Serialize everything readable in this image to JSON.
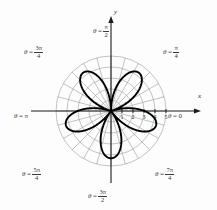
{
  "figure": {
    "name": "polar-rose-plot",
    "background": "#fdfdfd"
  },
  "axes": {
    "x_axis_label": "x",
    "y_axis_label": "y",
    "center_x": 111,
    "center_y": 111,
    "unit_px": 11,
    "grid_color": "#9a9a9a",
    "axis_color": "#1a1a1a",
    "curve_color": "#000000"
  },
  "tick_labels": [
    {
      "text": "1",
      "value": 1
    },
    {
      "text": "2",
      "value": 2
    },
    {
      "text": "3",
      "value": 3
    },
    {
      "text": "4",
      "value": 4
    },
    {
      "text": "5",
      "value": 5
    }
  ],
  "theta_labels": [
    {
      "id": "theta-0",
      "theta_text": "θ",
      "eq": "=",
      "value": "0",
      "num": "",
      "den": "",
      "is_fraction": false,
      "x": 168,
      "y": 113
    },
    {
      "id": "theta-pi-4",
      "theta_text": "θ",
      "eq": "=",
      "value": "",
      "num": "π",
      "den": "4",
      "is_fraction": true,
      "x": 163,
      "y": 45
    },
    {
      "id": "theta-pi-2",
      "theta_text": "θ",
      "eq": "=",
      "value": "",
      "num": "π",
      "den": "2",
      "is_fraction": true,
      "x": 93,
      "y": 24
    },
    {
      "id": "theta-3pi-4",
      "theta_text": "θ",
      "eq": "=",
      "value": "",
      "num": "3π",
      "den": "4",
      "is_fraction": true,
      "x": 24,
      "y": 45
    },
    {
      "id": "theta-pi",
      "theta_text": "θ",
      "eq": "=",
      "value": "π",
      "num": "",
      "den": "",
      "is_fraction": false,
      "x": 14,
      "y": 113
    },
    {
      "id": "theta-5pi-4",
      "theta_text": "θ",
      "eq": "=",
      "value": "",
      "num": "5π",
      "den": "4",
      "is_fraction": true,
      "x": 22,
      "y": 167
    },
    {
      "id": "theta-3pi-2",
      "theta_text": "θ",
      "eq": "=",
      "value": "",
      "num": "3π",
      "den": "2",
      "is_fraction": true,
      "x": 88,
      "y": 189
    },
    {
      "id": "theta-7pi-4",
      "theta_text": "θ",
      "eq": "=",
      "value": "",
      "num": "7π",
      "den": "4",
      "is_fraction": true,
      "x": 155,
      "y": 167
    }
  ],
  "chart_data": {
    "type": "line",
    "plot_kind": "polar",
    "title": "",
    "xlabel": "x",
    "ylabel": "y",
    "equation": "r = 4 sin(5θ)",
    "petal_count": 5,
    "petal_max_radius": 4.3,
    "radial_ticks": [
      1,
      2,
      3,
      4,
      5
    ],
    "radial_range": [
      0,
      5
    ],
    "grid": true,
    "angular_grid_step_deg": 15,
    "legend": "none",
    "annotations": [
      "θ = 0",
      "θ = π/4",
      "θ = π/2",
      "θ = 3π/4",
      "θ = π",
      "θ = 5π/4",
      "θ = 3π/2",
      "θ = 7π/4"
    ],
    "petal_tip_angles_deg": [
      90,
      162,
      234,
      306,
      18
    ],
    "series": [
      {
        "name": "rose",
        "r_of_theta": "4.3*|sin(2.5*theta)|",
        "values": [
          4.3,
          4.3,
          4.3,
          4.3,
          4.3
        ]
      }
    ]
  }
}
